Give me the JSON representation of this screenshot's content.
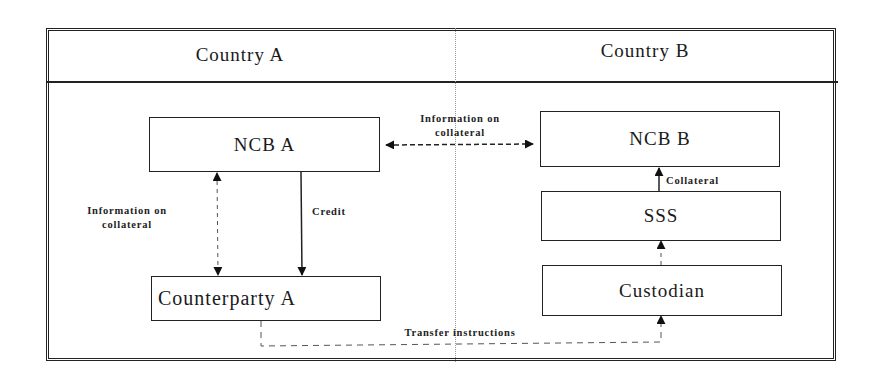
{
  "diagram": {
    "countries": [
      {
        "id": "country-a",
        "label": "Country A"
      },
      {
        "id": "country-b",
        "label": "Country B"
      }
    ],
    "nodes": {
      "ncb_a": {
        "label": "NCB A",
        "country": "Country A"
      },
      "counterparty_a": {
        "label": "Counterparty A",
        "country": "Country A"
      },
      "ncb_b": {
        "label": "NCB B",
        "country": "Country B"
      },
      "sss": {
        "label": "SSS",
        "country": "Country B"
      },
      "custodian": {
        "label": "Custodian",
        "country": "Country B"
      }
    },
    "edges": [
      {
        "from": "NCB A",
        "to": "NCB B",
        "style": "dashed",
        "direction": "both",
        "label_line1": "Information on",
        "label_line2": "collateral"
      },
      {
        "from": "NCB A",
        "to": "Counterparty A",
        "style": "dashed",
        "direction": "both",
        "label_line1": "Information on",
        "label_line2": "collateral"
      },
      {
        "from": "NCB A",
        "to": "Counterparty A",
        "style": "solid",
        "direction": "forward",
        "label": "Credit"
      },
      {
        "from": "SSS",
        "to": "NCB B",
        "style": "solid",
        "direction": "forward",
        "label": "Collateral"
      },
      {
        "from": "Custodian",
        "to": "SSS",
        "style": "dashed",
        "direction": "forward",
        "label": ""
      },
      {
        "from": "Counterparty A",
        "to": "Custodian",
        "style": "dashed",
        "direction": "forward",
        "label": "Transfer instructions"
      }
    ]
  },
  "colors": {
    "line": "#222222",
    "divider": "#9a9a9a",
    "background": "#ffffff"
  }
}
